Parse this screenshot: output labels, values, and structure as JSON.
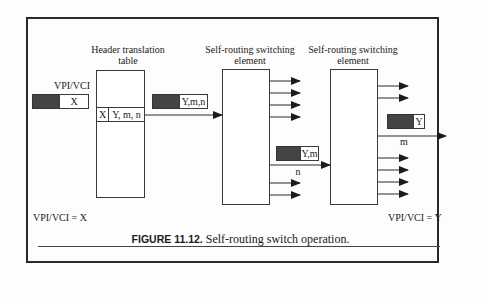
{
  "diagram": {
    "header_table": {
      "title_line1": "Header translation",
      "title_line2": "table",
      "row_key": "X",
      "row_value": "Y, m, n"
    },
    "input_cell": {
      "label": "VPI/VCI",
      "value": "X"
    },
    "element1": {
      "title_line1": "Self-routing switching",
      "title_line2": "element"
    },
    "element2": {
      "title_line1": "Self-routing switching",
      "title_line2": "element"
    },
    "cell_after_table": {
      "value": "Y,m,n"
    },
    "cell_after_element1": {
      "value": "Y,m",
      "port_label": "n"
    },
    "cell_after_element2": {
      "value": "Y",
      "port_label": "m"
    },
    "left_note": "VPI/VCI = X",
    "right_note": "VPI/VCI = Y"
  },
  "caption": {
    "figure_label": "FIGURE 11.12.",
    "text": "Self-routing switch operation."
  },
  "colors": {
    "dark_fill": "#444444",
    "line": "#2a2a2a"
  }
}
